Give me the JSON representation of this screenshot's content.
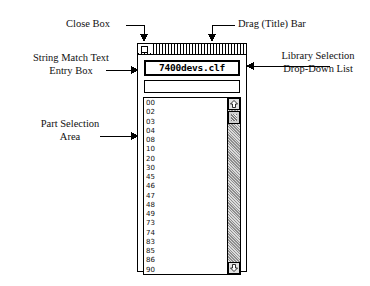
{
  "figure": {
    "annotations": [
      {
        "id": "close-box",
        "line1": "Close Box",
        "line2": ""
      },
      {
        "id": "drag-bar",
        "line1": "Drag (Title) Bar",
        "line2": ""
      },
      {
        "id": "string-match",
        "line1": "String Match Text",
        "line2": "Entry Box"
      },
      {
        "id": "library",
        "line1": "Library Selection",
        "line2": "Drop-Down List"
      },
      {
        "id": "part-area",
        "line1": "Part Selection",
        "line2": "Area"
      }
    ]
  },
  "window": {
    "title_bar": {
      "close_box_name": "close-box"
    },
    "library_dropdown": {
      "selected": "7400devs.clf",
      "options": [
        "7400devs.clf"
      ]
    },
    "match_field": {
      "value": "",
      "placeholder": ""
    },
    "part_list": {
      "items": [
        "00",
        "02",
        "03",
        "04",
        "08",
        "10",
        "20",
        "30",
        "45",
        "46",
        "47",
        "48",
        "49",
        "73",
        "74",
        "83",
        "85",
        "86",
        "90"
      ],
      "selected": ""
    },
    "scrollbar": {
      "up_arrow": "scroll-up-arrow-icon",
      "down_arrow": "scroll-down-arrow-icon",
      "thumb_position_percent": 3
    }
  },
  "colors": {
    "ink": "#000000",
    "paper": "#ffffff",
    "scroll_track": "#b9b9b9",
    "scroll_button": "#e2e2e2"
  }
}
